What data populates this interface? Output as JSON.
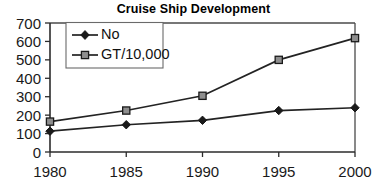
{
  "chart_data": {
    "type": "line",
    "title": "Cruise Ship Development",
    "xlabel": "",
    "ylabel": "",
    "x": [
      1980,
      1985,
      1990,
      1995,
      2000
    ],
    "categories": [
      "1980",
      "1985",
      "1990",
      "1995",
      "2000"
    ],
    "series": [
      {
        "name": "No",
        "marker": "filled-diamond",
        "values": [
          113,
          148,
          172,
          225,
          240
        ]
      },
      {
        "name": "GT/10,000",
        "marker": "open-square",
        "values": [
          165,
          225,
          305,
          500,
          618
        ]
      }
    ],
    "ylim": [
      0,
      700
    ],
    "yticks": [
      0,
      100,
      200,
      300,
      400,
      500,
      600,
      700
    ],
    "ytick_labels": [
      "0",
      "100",
      "200",
      "300",
      "400",
      "500",
      "600",
      "700"
    ],
    "xlim": [
      1980,
      2000
    ],
    "xticks": [
      1980,
      1985,
      1990,
      1995,
      2000
    ],
    "xtick_labels": [
      "1980",
      "1985",
      "1990",
      "1995",
      "2000"
    ],
    "grid": false,
    "legend_position": "upper-left-inside",
    "legend_entries": [
      "No",
      "GT/10,000"
    ],
    "colors": {
      "line": "#232323",
      "axis": "#2b2b2b",
      "background": "#ffffff",
      "square_marker_fill": "#8e8e8e",
      "diamond_marker_fill": "#1a1a1a"
    }
  }
}
